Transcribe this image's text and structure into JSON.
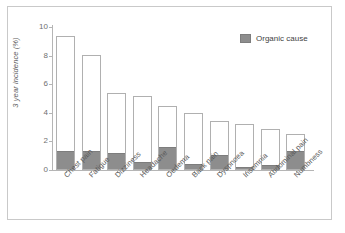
{
  "chart_data": {
    "type": "bar",
    "subtype": "stacked",
    "title": "",
    "xlabel": "",
    "ylabel": "3 year incidence (%)",
    "ylim": [
      0,
      10
    ],
    "yticks": [
      "0",
      "2",
      "4",
      "6",
      "8",
      "10"
    ],
    "grid": false,
    "legend": {
      "position": "top-right",
      "entries": [
        {
          "label": "Organic cause",
          "color": "#8d8d8d"
        }
      ]
    },
    "categories": [
      "Chest pain",
      "Fatigue",
      "Dizziness",
      "Headache",
      "Oedema",
      "Back pain",
      "Dyspnoea",
      "Insomnia",
      "Abdominal pain",
      "Numbness"
    ],
    "series": [
      {
        "name": "Organic cause",
        "color": "#8d8d8d",
        "values": [
          1.25,
          1.25,
          1.1,
          0.5,
          1.55,
          0.35,
          1.0,
          0.15,
          0.25,
          1.25
        ]
      },
      {
        "name": "Other cause",
        "color": "#ffffff",
        "values": [
          8.15,
          6.8,
          4.3,
          4.7,
          2.9,
          3.65,
          2.45,
          3.1,
          2.6,
          1.3
        ]
      }
    ],
    "totals": [
      9.4,
      8.05,
      5.4,
      5.2,
      4.45,
      4.0,
      3.45,
      3.25,
      2.85,
      2.55
    ]
  },
  "colors": {
    "organic": "#8d8d8d",
    "other": "#ffffff",
    "bar_border": "#b0b0b0",
    "axis": "#b5b5b5",
    "frame": "#c9c9c9",
    "text": "#5a5a5a"
  }
}
